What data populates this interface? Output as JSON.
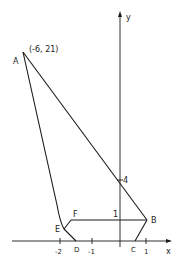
{
  "diagram": {
    "axes": {
      "x_label": "x",
      "y_label": "y",
      "x_ticks": [
        "-2",
        "-1",
        "1"
      ],
      "y_mark": "4",
      "mark_1": "1"
    },
    "points": {
      "A": {
        "label": "A",
        "coord_label": "(-6, 21)"
      },
      "B": {
        "label": "B"
      },
      "C": {
        "label": "C"
      },
      "D": {
        "label": "D"
      },
      "E": {
        "label": "E"
      },
      "F": {
        "label": "F"
      }
    }
  }
}
